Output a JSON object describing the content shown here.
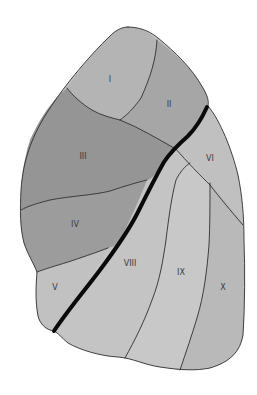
{
  "diagram": {
    "colors": {
      "background": "#ffffff",
      "outline": "#2e2e2e",
      "fissure": "#0a0a0a"
    },
    "segments": [
      {
        "id": "I",
        "label": "I",
        "fill": "#b4b4b4"
      },
      {
        "id": "II",
        "label": "II",
        "fill": "#a6a6a6"
      },
      {
        "id": "III",
        "label": "III",
        "fill": "#959595"
      },
      {
        "id": "IV",
        "label": "IV",
        "fill": "#9c9c9c"
      },
      {
        "id": "V",
        "label": "V",
        "fill": "#c1c1c1"
      },
      {
        "id": "VI",
        "label": "VI",
        "fill": "#c0c0c0"
      },
      {
        "id": "VIII",
        "label": "VIII",
        "fill": "#c4c4c4"
      },
      {
        "id": "IX",
        "label": "IX",
        "fill": "#c8c8c8"
      },
      {
        "id": "X",
        "label": "X",
        "fill": "#b9b9b9"
      }
    ]
  }
}
